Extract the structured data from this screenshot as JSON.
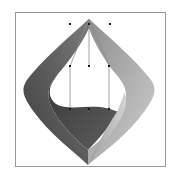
{
  "figure": {
    "type": "3d-surface-with-control-points",
    "frame": {
      "x": 15,
      "y": 12,
      "width": 150,
      "height": 154
    },
    "colors": {
      "background": "#ffffff",
      "frame": "#9a9a9a",
      "surface_dark": "#3c3c3c",
      "surface_mid": "#6e6e6e",
      "surface_light": "#b8b8b8",
      "surface_highlight": "#d8d8d8",
      "control_point": "#1a1a1a",
      "control_hull": "#8a8a8a"
    },
    "apex": {
      "x": 89,
      "y": 19
    },
    "bottom_tip": {
      "x": 88,
      "y": 165
    },
    "control_points": [
      {
        "row": "top",
        "x": 70,
        "y": 24
      },
      {
        "row": "top",
        "x": 89,
        "y": 24
      },
      {
        "row": "top",
        "x": 110,
        "y": 24
      },
      {
        "row": "middle",
        "x": 70,
        "y": 66
      },
      {
        "row": "middle",
        "x": 89,
        "y": 66
      },
      {
        "row": "middle",
        "x": 109,
        "y": 66
      },
      {
        "row": "bottom",
        "x": 70,
        "y": 109
      },
      {
        "row": "bottom",
        "x": 89,
        "y": 109
      },
      {
        "row": "bottom",
        "x": 109,
        "y": 109
      }
    ]
  }
}
